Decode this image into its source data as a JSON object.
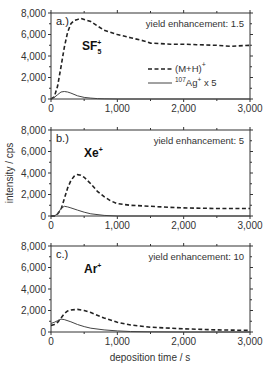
{
  "chart_data": {
    "type": "line",
    "xlabel": "deposition time / s",
    "ylabel": "intensity / cps",
    "xlim": [
      0,
      3000
    ],
    "ylim": [
      0,
      8000
    ],
    "x_ticks": [
      "0",
      "1,000",
      "2,000",
      "3,000"
    ],
    "y_ticks": [
      "0",
      "2,000",
      "4,000",
      "6,000",
      "8,000"
    ],
    "grid": false,
    "legend": {
      "position": "inside panel a, right-center",
      "entries": [
        {
          "label": "(M+H)+",
          "style": "dashed"
        },
        {
          "label": "107Ag+ x 5",
          "style": "solid"
        }
      ]
    },
    "panels": [
      {
        "panel_label": "a.)",
        "ion": "SF5+",
        "annotation": "yield enhancement: 1.5",
        "series": [
          {
            "name": "(M+H)+",
            "x": [
              0,
              50,
              100,
              150,
              200,
              250,
              300,
              350,
              400,
              450,
              500,
              600,
              700,
              800,
              1000,
              1200,
              1400,
              1500,
              1800,
              2000,
              2200,
              2500,
              2700,
              3000
            ],
            "values": [
              0,
              200,
              1200,
              3000,
              4800,
              6200,
              7000,
              7300,
              7400,
              7500,
              7400,
              7200,
              6800,
              6400,
              6000,
              5700,
              5400,
              5200,
              5100,
              5100,
              5050,
              5000,
              4900,
              5000
            ]
          },
          {
            "name": "107Ag+ x 5",
            "x": [
              0,
              50,
              100,
              150,
              200,
              250,
              300,
              400,
              500,
              600,
              700,
              800,
              1000,
              3000
            ],
            "values": [
              0,
              150,
              400,
              650,
              700,
              650,
              550,
              300,
              150,
              80,
              40,
              20,
              0,
              0
            ]
          }
        ]
      },
      {
        "panel_label": "b.)",
        "ion": "Xe+",
        "annotation": "yield enhancement: 5",
        "series": [
          {
            "name": "(M+H)+",
            "x": [
              0,
              50,
              100,
              150,
              200,
              250,
              300,
              350,
              400,
              450,
              500,
              600,
              700,
              800,
              900,
              1000,
              1200,
              1500,
              1800,
              2000,
              2500,
              3000
            ],
            "values": [
              0,
              0,
              200,
              600,
              1600,
              2600,
              3300,
              3700,
              3850,
              3800,
              3600,
              3000,
              2300,
              1800,
              1400,
              1150,
              1000,
              900,
              800,
              750,
              700,
              700
            ]
          },
          {
            "name": "107Ag+ x 5",
            "x": [
              0,
              50,
              100,
              150,
              200,
              250,
              300,
              400,
              500,
              600,
              800,
              1000,
              3000
            ],
            "values": [
              0,
              0,
              200,
              700,
              900,
              850,
              750,
              550,
              350,
              200,
              60,
              0,
              0
            ]
          }
        ]
      },
      {
        "panel_label": "c.)",
        "ion": "Ar+",
        "annotation": "yield enhancement: 10",
        "series": [
          {
            "name": "(M+H)+",
            "x": [
              0,
              50,
              100,
              150,
              200,
              250,
              300,
              400,
              500,
              600,
              800,
              1000,
              1200,
              1500,
              1800,
              2000,
              2500,
              3000
            ],
            "values": [
              600,
              700,
              900,
              1300,
              1700,
              1950,
              2050,
              2100,
              2000,
              1800,
              1300,
              900,
              650,
              450,
              350,
              300,
              200,
              150
            ]
          },
          {
            "name": "107Ag+ x 5",
            "x": [
              0,
              50,
              100,
              150,
              200,
              300,
              400,
              500,
              600,
              800,
              1000,
              1200,
              1500,
              2000,
              3000
            ],
            "values": [
              800,
              900,
              1050,
              1200,
              1150,
              950,
              700,
              500,
              350,
              200,
              100,
              50,
              20,
              0,
              0
            ]
          }
        ]
      }
    ]
  }
}
